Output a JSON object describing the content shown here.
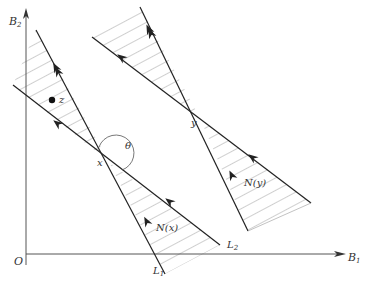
{
  "diagram": {
    "axes": {
      "y_label": "B",
      "y_label_sub": "2",
      "x_label": "B",
      "x_label_sub": "1",
      "origin_label": "O"
    },
    "lines": {
      "l1_label": "L",
      "l1_sub": "1",
      "l2_label": "L",
      "l2_sub": "2"
    },
    "points": {
      "x_label": "x",
      "y_label": "y",
      "z_label": "z"
    },
    "angle_label": "θ",
    "cones": {
      "nx_label": "N(x)",
      "ny_label": "N(y)"
    },
    "colors": {
      "line": "#222222",
      "hatch": "#888888",
      "axis": "#555555"
    }
  }
}
